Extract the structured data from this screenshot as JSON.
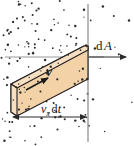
{
  "figure": {
    "width": 134,
    "height": 146,
    "background_color": "#ffffff"
  },
  "labels": {
    "area_element": {
      "d": "d",
      "symbol": "A"
    },
    "velocity": {
      "symbol": "v"
    },
    "length": {
      "symbol": "v",
      "subscript": "x",
      "d": "d",
      "t": "t"
    }
  },
  "colors": {
    "tube_fill": "#f4d2a8",
    "tube_cap_fill": "#f7e0c2",
    "tube_stroke": "#231f20",
    "plane_line": "#9a9a9a",
    "axis_line": "#8c8c8c",
    "dot_color": "#2b2b2b",
    "text_color": "#1a1a1a"
  },
  "geometry": {
    "plane_x": 88,
    "axis_y": 57,
    "measure_y": 117,
    "measure_x_start": 13,
    "measure_x_end": 86,
    "tube": {
      "top_face": "M 11,84 L 84,46 L 88,46 L 88,50 L 17,88 Z",
      "body": "M 11,84 L 84,46 L 88,46 L 88,79 L 17,116 Z",
      "cap": "M 11,84 L 17,88 L 17,116 L 11,112 Z"
    }
  },
  "dots": {
    "count": 210,
    "radius": 0.85,
    "region": "scattered particles representing fluid molecules"
  },
  "chart_data": {
    "type": "diagram",
    "annotations": [
      {
        "text": "dA",
        "meaning": "area element vector normal to the plane, pointing +x"
      },
      {
        "text": "v",
        "meaning": "fluid velocity vector, directed up and to the right"
      },
      {
        "text": "vx dt",
        "meaning": "horizontal extent of the slanted fluid volume"
      }
    ]
  }
}
